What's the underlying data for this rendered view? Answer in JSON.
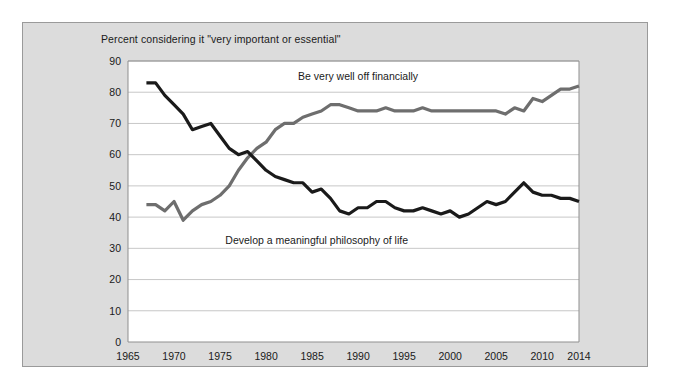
{
  "figure": {
    "title": "Percent considering it \"very important or essential\""
  },
  "chart_data": {
    "type": "line",
    "title": "Percent considering it \"very important or essential\"",
    "xlabel": "",
    "ylabel": "",
    "xlim": [
      1965,
      2014
    ],
    "ylim": [
      0,
      90
    ],
    "ytick_step": 10,
    "yticks": [
      0,
      10,
      20,
      30,
      40,
      50,
      60,
      70,
      80,
      90
    ],
    "xticks": [
      1965,
      1970,
      1975,
      1980,
      1985,
      1990,
      1995,
      2000,
      2005,
      2010,
      2014
    ],
    "grid": true,
    "legend_position": "inline-annotation",
    "colors": {
      "financially": "#6e6e6e",
      "philosophy": "#1a1a1a"
    },
    "series": [
      {
        "name": "Be very well off financially",
        "color": "#6e6e6e",
        "annotation": "Be very well off financially",
        "x": [
          1967,
          1968,
          1969,
          1970,
          1971,
          1972,
          1973,
          1974,
          1975,
          1976,
          1977,
          1978,
          1979,
          1980,
          1981,
          1982,
          1983,
          1984,
          1985,
          1986,
          1987,
          1988,
          1989,
          1990,
          1991,
          1992,
          1993,
          1994,
          1995,
          1996,
          1997,
          1998,
          1999,
          2000,
          2001,
          2002,
          2003,
          2004,
          2005,
          2006,
          2007,
          2008,
          2009,
          2010,
          2011,
          2012,
          2013,
          2014
        ],
        "values": [
          44,
          44,
          42,
          45,
          39,
          42,
          44,
          45,
          47,
          50,
          55,
          59,
          62,
          64,
          68,
          70,
          70,
          72,
          73,
          74,
          76,
          76,
          75,
          74,
          74,
          74,
          75,
          74,
          74,
          74,
          75,
          74,
          74,
          74,
          74,
          74,
          74,
          74,
          74,
          73,
          75,
          74,
          78,
          77,
          79,
          81,
          81,
          82
        ]
      },
      {
        "name": "Develop a meaningful philosophy of life",
        "color": "#1a1a1a",
        "annotation": "Develop a meaningful philosophy of life",
        "x": [
          1967,
          1968,
          1969,
          1970,
          1971,
          1972,
          1973,
          1974,
          1975,
          1976,
          1977,
          1978,
          1979,
          1980,
          1981,
          1982,
          1983,
          1984,
          1985,
          1986,
          1987,
          1988,
          1989,
          1990,
          1991,
          1992,
          1993,
          1994,
          1995,
          1996,
          1997,
          1998,
          1999,
          2000,
          2001,
          2002,
          2003,
          2004,
          2005,
          2006,
          2007,
          2008,
          2009,
          2010,
          2011,
          2012,
          2013,
          2014
        ],
        "values": [
          83,
          83,
          79,
          76,
          73,
          68,
          69,
          70,
          66,
          62,
          60,
          61,
          58,
          55,
          53,
          52,
          51,
          51,
          48,
          49,
          46,
          42,
          41,
          43,
          43,
          45,
          45,
          43,
          42,
          42,
          43,
          42,
          41,
          42,
          40,
          41,
          43,
          45,
          44,
          45,
          48,
          51,
          48,
          47,
          47,
          46,
          46,
          45
        ]
      }
    ]
  }
}
